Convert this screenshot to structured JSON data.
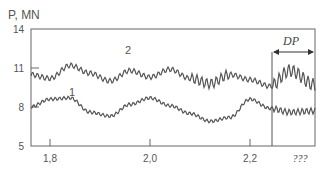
{
  "chart_data": {
    "type": "line",
    "title": "",
    "ylabel": "P, MN",
    "xlabel": "",
    "ylim": [
      5,
      14
    ],
    "xlim": [
      1.76,
      2.33
    ],
    "y_ticks": [
      "14",
      "11",
      "8",
      "5"
    ],
    "y_tick_values": [
      14,
      11,
      8,
      5
    ],
    "x_ticks": [
      "1,8",
      "2,0",
      "2,2",
      "???"
    ],
    "x_tick_values": [
      1.8,
      2.0,
      2.2,
      null
    ],
    "grid": false,
    "legend": "inline curve labels",
    "series": [
      {
        "name": "1",
        "description": "lower curve, low-amplitude oscillation around 8 MN",
        "x": [
          1.76,
          1.8,
          1.84,
          1.88,
          1.92,
          1.96,
          2.0,
          2.04,
          2.08,
          2.12,
          2.16,
          2.2,
          2.24,
          2.28,
          2.33
        ],
        "values": [
          8.0,
          8.6,
          8.7,
          7.6,
          7.3,
          8.2,
          8.7,
          8.1,
          7.5,
          6.9,
          7.2,
          8.6,
          7.9,
          7.6,
          7.7
        ]
      },
      {
        "name": "2",
        "description": "upper curve, higher-amplitude oscillation around 10.5 MN",
        "x": [
          1.76,
          1.8,
          1.84,
          1.88,
          1.92,
          1.96,
          2.0,
          2.04,
          2.08,
          2.12,
          2.16,
          2.2,
          2.24,
          2.28,
          2.33
        ],
        "values": [
          10.5,
          10.2,
          11.2,
          10.6,
          10.0,
          10.8,
          10.3,
          10.9,
          10.2,
          9.8,
          10.5,
          10.1,
          9.6,
          10.8,
          9.7
        ]
      }
    ],
    "annotations": [
      {
        "text": "DP",
        "type": "double-arrow span",
        "x_start": 2.244,
        "x_end": 2.33
      },
      {
        "text": "1",
        "target_series": "1"
      },
      {
        "text": "2",
        "target_series": "2"
      }
    ]
  },
  "labels": {
    "y_axis_title": "P, MN",
    "curve1": "1",
    "curve2": "2",
    "span": "DP"
  }
}
